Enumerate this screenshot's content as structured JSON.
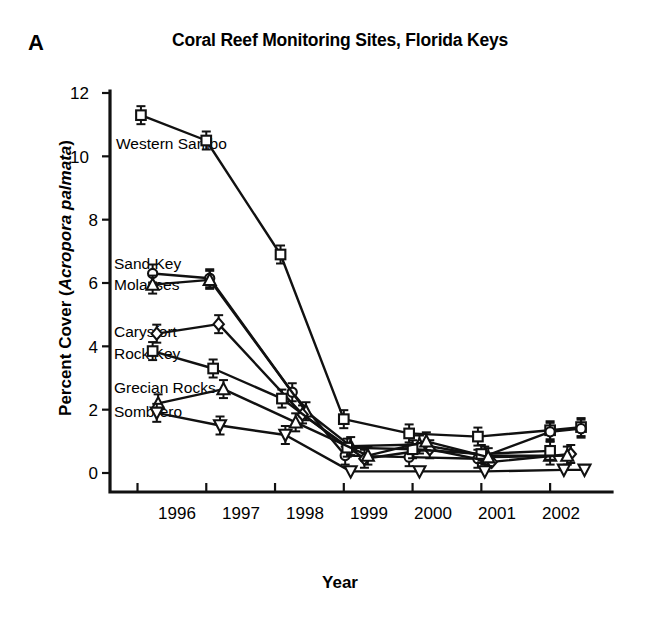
{
  "figure": {
    "panel_letter": "A",
    "title": "Coral Reef Monitoring Sites, Florida Keys"
  },
  "axes": {
    "y_title_prefix": "Percent Cover (",
    "y_title_italic": "Acropora palmata",
    "y_title_suffix": ")",
    "x_title": "Year",
    "y_ticks": [
      "0",
      "2",
      "4",
      "6",
      "8",
      "10",
      "12"
    ],
    "x_ticks": [
      "1996",
      "1997",
      "1998",
      "1999",
      "2000",
      "2001",
      "2002"
    ]
  },
  "series_labels": [
    {
      "name": "western-sambo",
      "text": "Western Sambo"
    },
    {
      "name": "sand-key",
      "text": "Sand Key"
    },
    {
      "name": "molasses",
      "text": "Molasses"
    },
    {
      "name": "carysfort",
      "text": "Carysfort"
    },
    {
      "name": "rock-key",
      "text": "Rock Key"
    },
    {
      "name": "grecian-rocks",
      "text": "Grecian Rocks"
    },
    {
      "name": "sombrero",
      "text": "Sombrero"
    }
  ],
  "chart_data": {
    "type": "line",
    "title": "Coral Reef Monitoring Sites, Florida Keys",
    "panel": "A",
    "xlabel": "Year",
    "ylabel": "Percent Cover (Acropora palmata)",
    "xlim": [
      1995.6,
      2002.9
    ],
    "ylim": [
      0,
      12
    ],
    "yticks": [
      0,
      2,
      4,
      6,
      8,
      10,
      12
    ],
    "xticks": [
      1996,
      1997,
      1998,
      1999,
      2000,
      2001,
      2002
    ],
    "grid": false,
    "legend": "inline-labels-left",
    "series": [
      {
        "name": "Western Sambo",
        "marker": "open-square",
        "x": [
          1996.05,
          1997.0,
          1998.08,
          1999.0,
          1999.95,
          2000.95,
          2002.0,
          2002.45
        ],
        "y": [
          11.3,
          10.5,
          6.9,
          1.7,
          1.25,
          1.15,
          1.35,
          1.45
        ]
      },
      {
        "name": "Sand Key",
        "marker": "open-circle",
        "x": [
          1996.22,
          1997.05,
          1998.25,
          1999.02,
          1999.95,
          2000.95,
          2002.0,
          2002.45
        ],
        "y": [
          6.3,
          6.15,
          2.55,
          0.55,
          0.5,
          0.45,
          1.3,
          1.4
        ]
      },
      {
        "name": "Molasses",
        "marker": "open-triangle-up",
        "x": [
          1996.22,
          1997.05,
          1998.45,
          1999.1,
          2000.1,
          2001.05,
          2002.0
        ],
        "y": [
          5.95,
          6.1,
          1.95,
          0.85,
          0.9,
          0.55,
          0.55
        ]
      },
      {
        "name": "Carysfort",
        "marker": "open-diamond",
        "x": [
          1996.28,
          1997.18,
          1998.4,
          1999.3,
          2000.25,
          2001.15,
          2002.3
        ],
        "y": [
          4.4,
          4.7,
          1.85,
          0.45,
          0.75,
          0.35,
          0.6
        ]
      },
      {
        "name": "Rock Key",
        "marker": "open-square",
        "x": [
          1996.22,
          1997.1,
          1998.1,
          1999.05,
          2000.0,
          2001.0,
          2002.0
        ],
        "y": [
          3.85,
          3.3,
          2.35,
          0.8,
          0.75,
          0.6,
          0.7
        ]
      },
      {
        "name": "Grecian Rocks",
        "marker": "open-triangle-up",
        "x": [
          1996.3,
          1997.25,
          1998.3,
          1999.35,
          2000.2,
          2001.1,
          2002.25
        ],
        "y": [
          2.2,
          2.65,
          1.6,
          0.55,
          1.0,
          0.5,
          0.55
        ]
      },
      {
        "name": "Sombrero",
        "marker": "open-triangle-down",
        "x": [
          1996.28,
          1997.2,
          1998.15,
          1999.1,
          2000.1,
          2001.05,
          2002.2,
          2002.5
        ],
        "y": [
          1.9,
          1.5,
          1.2,
          0.05,
          0.05,
          0.05,
          0.1,
          0.1
        ]
      }
    ]
  }
}
